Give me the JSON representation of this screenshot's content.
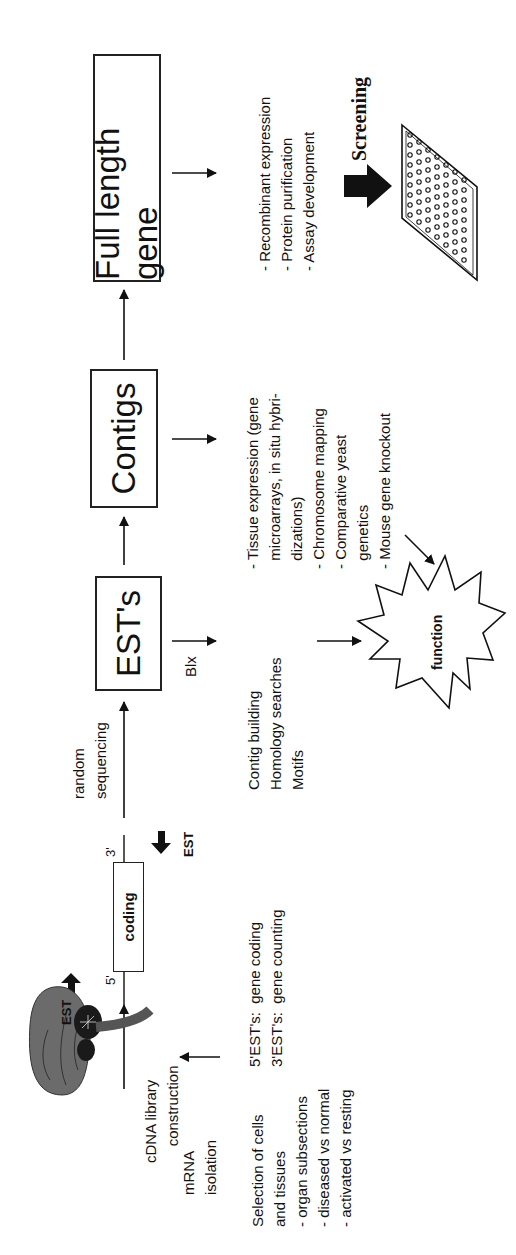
{
  "diagram": {
    "type": "flowchart",
    "orientation": "rotated-90-ccw",
    "stages": [
      {
        "id": "cdna",
        "label": "cDNA library\n    construction"
      },
      {
        "id": "ests",
        "label": "EST's"
      },
      {
        "id": "contigs",
        "label": "Contigs"
      },
      {
        "id": "full_length_gene",
        "label": "Full length gene"
      }
    ],
    "mrna": {
      "label": "mRNA\nisolation"
    },
    "selection": {
      "label": "Selection of cells\nand tissues\n- organ subsections\n- diseased vs normal\n- activated vs resting"
    },
    "coding_segment": {
      "label": "coding",
      "five_prime": "5'",
      "three_prime": "3'",
      "est_left": "EST",
      "est_right": "EST"
    },
    "est_types": {
      "text": "5'EST's:  gene coding\n3'EST's:  gene counting"
    },
    "random_sequencing": {
      "label": "random\nsequencing"
    },
    "blx": {
      "label": "Blx"
    },
    "est_analysis": {
      "text": "Contig building\nHomology searches\nMotifs"
    },
    "contig_analysis": {
      "text": "- Tissue expression (gene\n  microarrays, in situ hybri-\n  dizations)\n- Chromosome mapping\n- Comparative yeast\n  genetics\n- Mouse gene knockout"
    },
    "gene_analysis": {
      "text": "- Recombinant expression\n- Protein purification\n- Assay development"
    },
    "function_burst": {
      "label": "function"
    },
    "screening": {
      "label": "Screening"
    },
    "icons": {
      "brain": "brain-illustration",
      "plate": "microtiter-plate-icon",
      "burst": "starburst-icon"
    }
  }
}
